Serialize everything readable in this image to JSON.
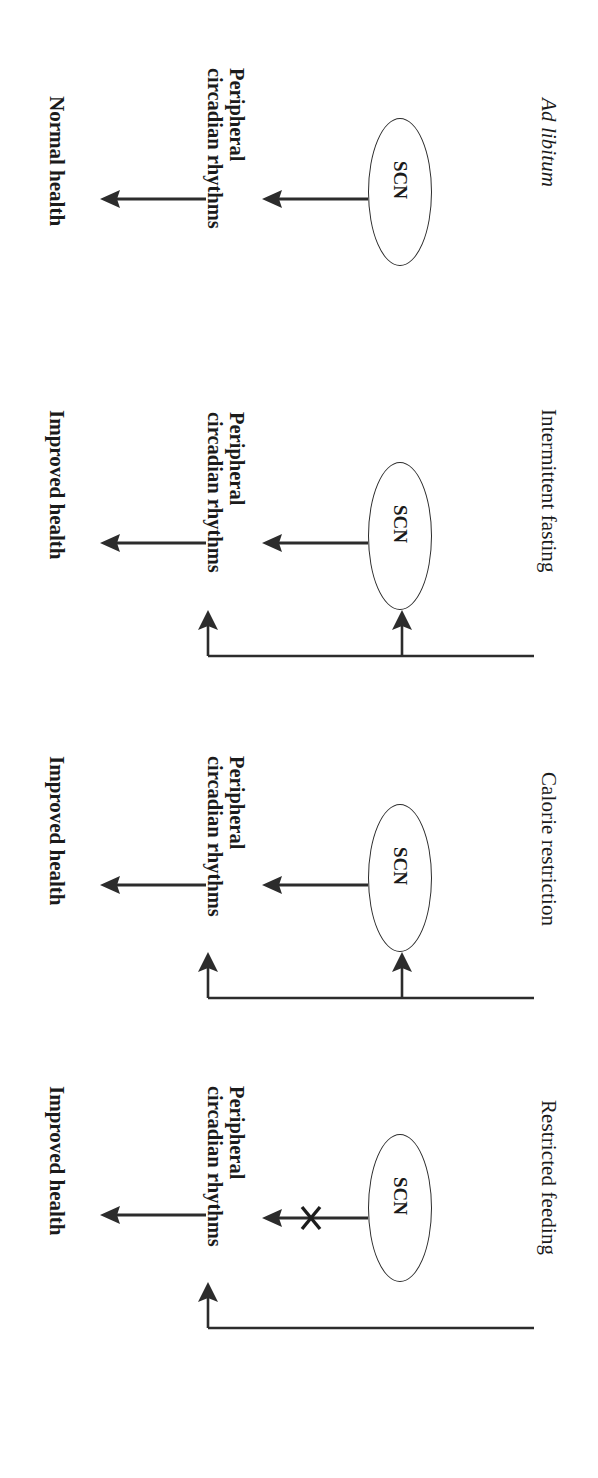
{
  "figure": {
    "orientation": "rotated-90-clockwise",
    "background_color": "#ffffff",
    "ink_color": "#2c2c2c",
    "panel_count": 4,
    "shared_labels": {
      "clock_node": "SCN",
      "peripheral_line1": "Peripheral",
      "peripheral_line2": "circadian rhythms"
    }
  },
  "panels": [
    {
      "id": "ad-libitum",
      "title": "Ad libitum",
      "title_style": "italic",
      "clock_node": "SCN",
      "peripheral_line1": "Peripheral",
      "peripheral_line2": "circadian rhythms",
      "outcome": "Normal health",
      "has_feeding_baseline": false,
      "baseline_branches": 0,
      "scn_link_blocked": false
    },
    {
      "id": "intermittent-fasting",
      "title": "Intermittent fasting",
      "title_style": "regular",
      "clock_node": "SCN",
      "peripheral_line1": "Peripheral",
      "peripheral_line2": "circadian rhythms",
      "outcome": "Improved health",
      "has_feeding_baseline": true,
      "baseline_branches": 2,
      "scn_link_blocked": false
    },
    {
      "id": "calorie-restriction",
      "title": "Calorie restriction",
      "title_style": "regular",
      "clock_node": "SCN",
      "peripheral_line1": "Peripheral",
      "peripheral_line2": "circadian rhythms",
      "outcome": "Improved health",
      "has_feeding_baseline": true,
      "baseline_branches": 2,
      "scn_link_blocked": false
    },
    {
      "id": "restricted-feeding",
      "title": "Restricted feeding",
      "title_style": "regular",
      "clock_node": "SCN",
      "peripheral_line1": "Peripheral",
      "peripheral_line2": "circadian rhythms",
      "outcome": "Improved health",
      "has_feeding_baseline": true,
      "baseline_branches": 1,
      "scn_link_blocked": true
    }
  ]
}
